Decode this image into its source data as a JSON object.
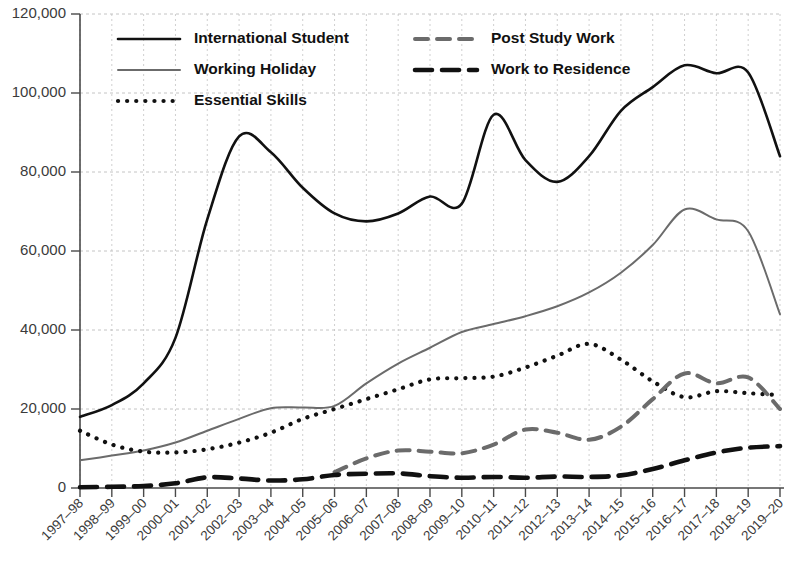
{
  "chart_data": {
    "type": "line",
    "title": "",
    "xlabel": "",
    "ylabel": "",
    "ylim": [
      0,
      120000
    ],
    "ytick_values": [
      0,
      20000,
      40000,
      60000,
      80000,
      100000,
      120000
    ],
    "ytick_labels": [
      "0",
      "20,000",
      "40,000",
      "60,000",
      "80,000",
      "100,000",
      "120,000"
    ],
    "grid": true,
    "legend_position": "top-inside",
    "categories": [
      "1997–98",
      "1998–99",
      "1999–00",
      "2000–01",
      "2001–02",
      "2002–03",
      "2003–04",
      "2004–05",
      "2005–06",
      "2006–07",
      "2007–08",
      "2008–09",
      "2009–10",
      "2010–11",
      "2011–12",
      "2012–13",
      "2013–14",
      "2014–15",
      "2015–16",
      "2016–17",
      "2017–18",
      "2018–19",
      "2019–20"
    ],
    "series": [
      {
        "name": "International Student",
        "style": "solid",
        "color": "#111111",
        "width": 2.6,
        "values": [
          18000,
          21000,
          26500,
          38000,
          68000,
          89000,
          85000,
          76000,
          69500,
          67500,
          69500,
          73800,
          72000,
          94500,
          83000,
          77500,
          84000,
          95500,
          101500,
          107000,
          105000,
          105200,
          84000
        ]
      },
      {
        "name": "Working Holiday",
        "style": "solid",
        "color": "#6b6b6b",
        "width": 2.0,
        "values": [
          7000,
          8200,
          9500,
          11500,
          14500,
          17500,
          20200,
          20400,
          20800,
          26500,
          31500,
          35500,
          39500,
          41500,
          43500,
          46000,
          49500,
          54500,
          61500,
          70500,
          68000,
          65000,
          44000
        ]
      },
      {
        "name": "Essential Skills",
        "style": "dotted",
        "color": "#111111",
        "width": 4.2,
        "values": [
          14500,
          11000,
          9200,
          9000,
          9800,
          11500,
          14000,
          17500,
          20000,
          22500,
          25000,
          27500,
          27800,
          28200,
          30500,
          33500,
          36500,
          32500,
          27000,
          23000,
          24500,
          24000,
          23500
        ]
      },
      {
        "name": "Post Study Work",
        "style": "dashed-light",
        "color": "#6b6b6b",
        "width": 4.0,
        "values": [
          null,
          null,
          null,
          null,
          null,
          null,
          null,
          null,
          4000,
          7500,
          9500,
          9200,
          8800,
          11000,
          14800,
          14000,
          12200,
          15500,
          22500,
          29000,
          26500,
          28000,
          20000
        ]
      },
      {
        "name": "Work to Residence",
        "style": "dashed-bold",
        "color": "#111111",
        "width": 4.6,
        "values": [
          200,
          300,
          500,
          1200,
          2700,
          2400,
          1900,
          2200,
          3300,
          3600,
          3700,
          3000,
          2600,
          2800,
          2600,
          2900,
          2800,
          3200,
          4800,
          7000,
          9000,
          10200,
          10600
        ]
      }
    ],
    "essential_skills_dotted_note": "",
    "xaxis_tick_count": 23
  },
  "legend": {
    "entries": [
      {
        "label": "International Student",
        "swatch": "solid-black"
      },
      {
        "label": "Working Holiday",
        "swatch": "solid-gray"
      },
      {
        "label": "Essential Skills",
        "swatch": "dotted-black"
      },
      {
        "label": "Post Study Work",
        "swatch": "dashed-gray"
      },
      {
        "label": "Work to Residence",
        "swatch": "dashed-black"
      }
    ]
  }
}
